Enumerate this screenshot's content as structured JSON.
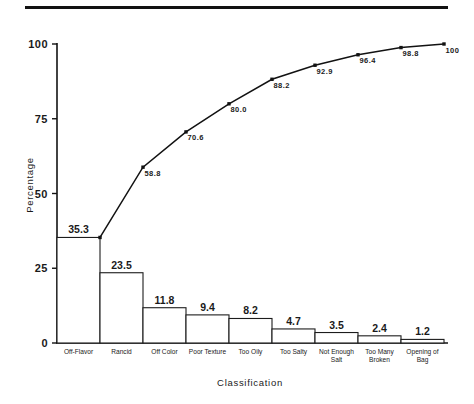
{
  "figure": {
    "has_top_rule": true,
    "background_color": "#ffffff",
    "ink_color": "#121212"
  },
  "chart_data": {
    "type": "bar",
    "title": "",
    "subtitle": "",
    "xlabel": "Classification",
    "ylabel": "Percentage",
    "ylim": [
      0,
      100
    ],
    "ytick_labels": [
      "100",
      "75",
      "50",
      "25",
      "0"
    ],
    "ytick_values": [
      100,
      75,
      50,
      25,
      0
    ],
    "grid": false,
    "legend": false,
    "legend_position": "none",
    "categories": [
      "Off-Flavor",
      "Rancid",
      "Off Color",
      "Poor Texture",
      "Too Oily",
      "Too Salty",
      "Not Enough Salt",
      "Too Many Broken",
      "Opening of Bag"
    ],
    "category_lines": [
      [
        "Off-Flavor"
      ],
      [
        "Rancid"
      ],
      [
        "Off Color"
      ],
      [
        "Poor Texture"
      ],
      [
        "Too Oily"
      ],
      [
        "Too Salty"
      ],
      [
        "Not Enough",
        "Salt"
      ],
      [
        "Too Many",
        "Broken"
      ],
      [
        "Opening of",
        "Bag"
      ]
    ],
    "series": [
      {
        "name": "Percentage",
        "kind": "bar",
        "values": [
          35.3,
          23.5,
          11.8,
          9.4,
          8.2,
          4.7,
          3.5,
          2.4,
          1.2
        ],
        "labels": [
          "35.3",
          "23.5",
          "11.8",
          "9.4",
          "8.2",
          "4.7",
          "3.5",
          "2.4",
          "1.2"
        ]
      },
      {
        "name": "Cumulative Percentage",
        "kind": "line",
        "values": [
          35.3,
          58.8,
          70.6,
          80.0,
          88.2,
          92.9,
          96.4,
          98.8,
          100
        ],
        "labels": [
          "35.3",
          "58.8",
          "70.6",
          "80.0",
          "88.2",
          "92.9",
          "96.4",
          "98.8",
          "100"
        ],
        "visible_labels": [
          "58.8",
          "70.6",
          "80.0",
          "88.2",
          "92.9",
          "96.4",
          "98.8",
          "100"
        ]
      }
    ]
  }
}
